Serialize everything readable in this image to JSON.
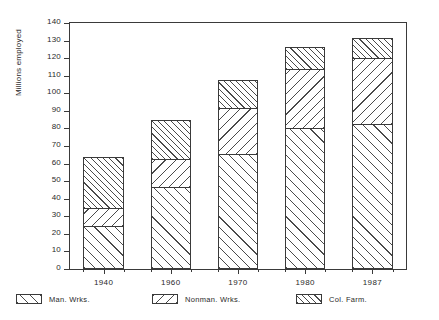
{
  "chart_data": {
    "type": "bar",
    "subtype": "stacked-bar",
    "title": "",
    "xlabel": "",
    "ylabel": "Millions employed",
    "categories": [
      "1940",
      "1960",
      "1970",
      "1980",
      "1987"
    ],
    "ylim": [
      0,
      140
    ],
    "yticks": [
      0,
      10,
      20,
      30,
      40,
      50,
      60,
      70,
      80,
      90,
      100,
      110,
      120,
      130,
      140
    ],
    "ytick_labels": [
      "0",
      "10",
      "20",
      "30",
      "40",
      "50",
      "60",
      "70",
      "80",
      "90",
      "100",
      "110",
      "120",
      "130",
      "140"
    ],
    "grid": false,
    "legend_position": "below",
    "series": [
      {
        "name": "Man. Wrks.",
        "pattern": "diagonal-forward",
        "values": [
          24,
          46,
          65,
          79.5,
          82
        ]
      },
      {
        "name": "Nonman. Wrks.",
        "pattern": "diagonal-backward",
        "values": [
          10,
          16,
          26,
          33.5,
          37.5
        ]
      },
      {
        "name": "Col. Farm.",
        "pattern": "diagonal-forward-dense",
        "values": [
          29,
          22,
          16,
          13,
          11.5
        ]
      }
    ],
    "stack_tops": {
      "1940": [
        24,
        34,
        63
      ],
      "1960": [
        46,
        62,
        84
      ],
      "1970": [
        65,
        91,
        107
      ],
      "1980": [
        79.5,
        113,
        126
      ],
      "1987": [
        82,
        119.5,
        131
      ]
    },
    "totals": [
      63,
      84,
      107,
      126,
      131
    ],
    "colors": {
      "axis": "#3a3a3a",
      "hatch": "#4a4a4a",
      "background": "#ffffff"
    }
  },
  "axis": {
    "y_title": "Millions employed"
  },
  "legend": {
    "items": [
      {
        "label": "Man. Wrks."
      },
      {
        "label": "Nonman. Wrks."
      },
      {
        "label": "Col. Farm."
      }
    ]
  }
}
